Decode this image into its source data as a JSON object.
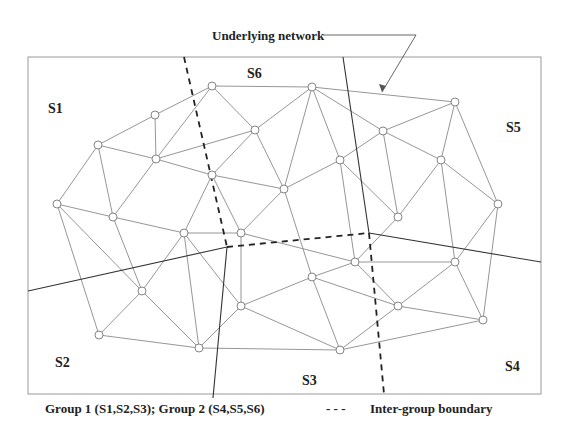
{
  "title_label": "Underlying network",
  "regions": [
    {
      "id": "S1",
      "label": "S1",
      "x": 48,
      "y": 113
    },
    {
      "id": "S2",
      "label": "S2",
      "x": 55,
      "y": 367
    },
    {
      "id": "S3",
      "label": "S3",
      "x": 302,
      "y": 385
    },
    {
      "id": "S4",
      "label": "S4",
      "x": 505,
      "y": 371
    },
    {
      "id": "S5",
      "label": "S5",
      "x": 506,
      "y": 132
    },
    {
      "id": "S6",
      "label": "S6",
      "x": 247,
      "y": 78
    }
  ],
  "caption": {
    "groups": "Group 1 (S1,S2,S3);  Group 2 (S4,S5,S6)",
    "legend_symbol": "- - -",
    "legend_text": "Inter-group boundary"
  },
  "colors": {
    "edge": "#8a8a8a",
    "node": "#777777",
    "boundary": "#333333",
    "dashed": "#222222",
    "frame": "#999999"
  },
  "nodes": [
    [
      212,
      86
    ],
    [
      312,
      87
    ],
    [
      455,
      102
    ],
    [
      155,
      115
    ],
    [
      98,
      145
    ],
    [
      255,
      130
    ],
    [
      383,
      131
    ],
    [
      156,
      159
    ],
    [
      340,
      160
    ],
    [
      441,
      160
    ],
    [
      212,
      175
    ],
    [
      284,
      189
    ],
    [
      57,
      204
    ],
    [
      498,
      204
    ],
    [
      113,
      217
    ],
    [
      398,
      217
    ],
    [
      184,
      233
    ],
    [
      241,
      233
    ],
    [
      355,
      262
    ],
    [
      455,
      262
    ],
    [
      312,
      277
    ],
    [
      142,
      291
    ],
    [
      241,
      306
    ],
    [
      398,
      306
    ],
    [
      483,
      320
    ],
    [
      99,
      335
    ],
    [
      199,
      348
    ],
    [
      340,
      350
    ]
  ],
  "edges": [
    [
      0,
      1
    ],
    [
      1,
      2
    ],
    [
      0,
      3
    ],
    [
      3,
      4
    ],
    [
      0,
      7
    ],
    [
      0,
      5
    ],
    [
      3,
      7
    ],
    [
      4,
      7
    ],
    [
      4,
      12
    ],
    [
      4,
      14
    ],
    [
      7,
      10
    ],
    [
      7,
      5
    ],
    [
      5,
      1
    ],
    [
      5,
      10
    ],
    [
      5,
      11
    ],
    [
      1,
      11
    ],
    [
      1,
      6
    ],
    [
      1,
      8
    ],
    [
      6,
      2
    ],
    [
      2,
      9
    ],
    [
      2,
      13
    ],
    [
      6,
      8
    ],
    [
      6,
      9
    ],
    [
      6,
      15
    ],
    [
      8,
      11
    ],
    [
      8,
      15
    ],
    [
      8,
      18
    ],
    [
      9,
      13
    ],
    [
      9,
      15
    ],
    [
      9,
      19
    ],
    [
      13,
      19
    ],
    [
      13,
      24
    ],
    [
      10,
      16
    ],
    [
      10,
      17
    ],
    [
      10,
      11
    ],
    [
      11,
      17
    ],
    [
      11,
      20
    ],
    [
      14,
      16
    ],
    [
      14,
      7
    ],
    [
      14,
      21
    ],
    [
      12,
      14
    ],
    [
      12,
      21
    ],
    [
      12,
      25
    ],
    [
      16,
      17
    ],
    [
      16,
      21
    ],
    [
      16,
      22
    ],
    [
      16,
      26
    ],
    [
      17,
      22
    ],
    [
      17,
      18
    ],
    [
      18,
      19
    ],
    [
      18,
      20
    ],
    [
      18,
      23
    ],
    [
      15,
      18
    ],
    [
      19,
      23
    ],
    [
      19,
      24
    ],
    [
      20,
      22
    ],
    [
      20,
      23
    ],
    [
      20,
      27
    ],
    [
      21,
      25
    ],
    [
      21,
      26
    ],
    [
      22,
      26
    ],
    [
      22,
      27
    ],
    [
      23,
      24
    ],
    [
      23,
      27
    ],
    [
      24,
      27
    ],
    [
      25,
      26
    ],
    [
      26,
      27
    ]
  ]
}
